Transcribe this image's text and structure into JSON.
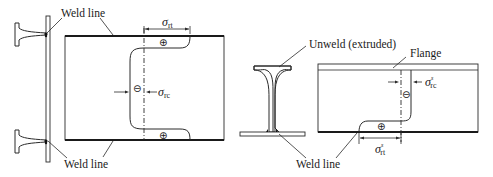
{
  "figure": {
    "left_panel": {
      "title": "Welded section residual stress",
      "labels": {
        "weld_line_top": "Weld line",
        "weld_line_bottom": "Weld line"
      },
      "symbols": {
        "tension": {
          "base": "σ",
          "sub": "rt"
        },
        "compression": {
          "base": "σ",
          "sub": "rc"
        }
      },
      "signs": {
        "top_plus": "⊕",
        "middle_minus": "⊖",
        "bottom_plus": "⊕"
      }
    },
    "right_panel": {
      "title": "Extruded section residual stress",
      "labels": {
        "unweld": "Unweld (extruded)",
        "flange": "Flange",
        "weld_line": "Weld line"
      },
      "symbols": {
        "compression": {
          "base": "σ",
          "sub": "rc",
          "sup": "s"
        },
        "tension": {
          "base": "σ",
          "sub": "rt",
          "sup": "s"
        }
      },
      "signs": {
        "minus": "⊖",
        "plus": "⊕"
      }
    }
  }
}
